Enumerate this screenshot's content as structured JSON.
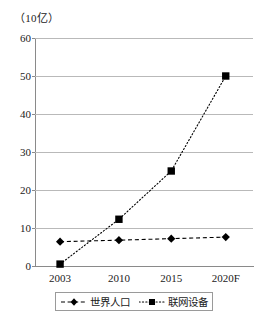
{
  "chart_data": {
    "type": "line",
    "title": "",
    "subtitle": "",
    "unit_label": "（10亿）",
    "xlabel": "",
    "ylabel": "",
    "categories": [
      "2003",
      "2010",
      "2015",
      "2020F"
    ],
    "yticks": [
      "0",
      "10",
      "20",
      "30",
      "40",
      "50",
      "60"
    ],
    "ylim": [
      0,
      60
    ],
    "grid": true,
    "legend_position": "bottom",
    "series": [
      {
        "name": "世界人口",
        "marker": "diamond",
        "line_style": "dashed",
        "color": "#000000",
        "values": [
          6.4,
          6.8,
          7.2,
          7.6
        ]
      },
      {
        "name": "联网设备",
        "marker": "square",
        "line_style": "dotted",
        "color": "#000000",
        "values": [
          0.5,
          12.3,
          25.0,
          50.0
        ]
      }
    ]
  },
  "legend": {
    "items": [
      {
        "label": "世界人口",
        "marker": "diamond-marker",
        "style": "dashed"
      },
      {
        "label": "联网设备",
        "marker": "square-marker",
        "style": "dotted"
      }
    ]
  },
  "colors": {
    "axis": "#8a8a8a",
    "grid": "#b9b9b9",
    "series": "#000000",
    "text": "#1a1a1a",
    "background": "#ffffff"
  }
}
